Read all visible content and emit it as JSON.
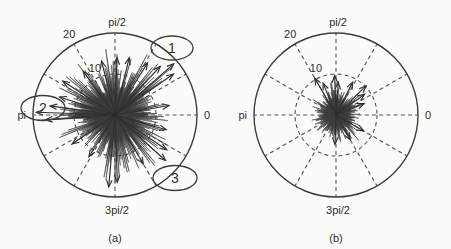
{
  "figure": {
    "background_color": "#fbfbf9",
    "ink_color": "#3c3c3c",
    "blob_color": "#3b3b3b"
  },
  "panels": [
    {
      "caption": "(a)",
      "center": {
        "x": 115,
        "y": 115
      },
      "radius_px": 82,
      "angle_labels": {
        "right": "0",
        "top": "pi/2",
        "left": "pi",
        "bottom": "3pi/2"
      },
      "radial_ticks": [
        {
          "label": "10",
          "value": 10
        },
        {
          "label": "20",
          "value": 20
        }
      ],
      "callouts": [
        {
          "label": "1",
          "cx": 172,
          "cy": 48,
          "rx": 21,
          "ry": 12
        },
        {
          "label": "2",
          "cx": 43,
          "cy": 108,
          "rx": 22,
          "ry": 12.5
        },
        {
          "label": "3",
          "cx": 175,
          "cy": 178,
          "rx": 22,
          "ry": 12.5
        }
      ]
    },
    {
      "caption": "(b)",
      "center": {
        "x": 336,
        "y": 115
      },
      "radius_px": 82,
      "angle_labels": {
        "right": "0",
        "top": "pi/2",
        "left": "pi",
        "bottom": "3pi/2"
      },
      "radial_ticks": [
        {
          "label": "10",
          "value": 10
        },
        {
          "label": "20",
          "value": 20
        }
      ],
      "callouts": []
    }
  ],
  "chart_data": {
    "type": "scatter",
    "subtype": "polar-vector-compass",
    "title": "",
    "xlabel": "",
    "ylabel": "",
    "grid": true,
    "legend_position": "none",
    "angular_unit": "radians",
    "angular_tick_labels": [
      "0",
      "pi/2",
      "pi",
      "3pi/2"
    ],
    "angular_tick_values": [
      0,
      1.5708,
      3.1416,
      4.7124
    ],
    "radial_tick_labels": [
      "10",
      "20"
    ],
    "radial_ticks": [
      10,
      20
    ],
    "rlim": [
      0,
      20
    ],
    "spoke_count": 12,
    "spoke_step_degrees": 30,
    "panels": [
      {
        "name": "(a)",
        "description": "Dense polar vector scatter; many vectors, large spiky envelope, three highlighted outliers",
        "envelope_mean_r": 9.5,
        "envelope_max_r": 18,
        "envelope": [
          {
            "theta_deg": 0,
            "r": 11.5
          },
          {
            "theta_deg": 6,
            "r": 9.0
          },
          {
            "theta_deg": 12,
            "r": 10.4
          },
          {
            "theta_deg": 18,
            "r": 8.2
          },
          {
            "theta_deg": 24,
            "r": 12.0
          },
          {
            "theta_deg": 30,
            "r": 9.1
          },
          {
            "theta_deg": 36,
            "r": 14.5
          },
          {
            "theta_deg": 42,
            "r": 10.2
          },
          {
            "theta_deg": 48,
            "r": 12.8
          },
          {
            "theta_deg": 54,
            "r": 9.4
          },
          {
            "theta_deg": 60,
            "r": 13.6
          },
          {
            "theta_deg": 66,
            "r": 10.0
          },
          {
            "theta_deg": 72,
            "r": 11.2
          },
          {
            "theta_deg": 78,
            "r": 8.6
          },
          {
            "theta_deg": 84,
            "r": 12.4
          },
          {
            "theta_deg": 90,
            "r": 10.6
          },
          {
            "theta_deg": 96,
            "r": 13.2
          },
          {
            "theta_deg": 102,
            "r": 9.0
          },
          {
            "theta_deg": 108,
            "r": 11.0
          },
          {
            "theta_deg": 114,
            "r": 8.4
          },
          {
            "theta_deg": 120,
            "r": 10.2
          },
          {
            "theta_deg": 126,
            "r": 12.2
          },
          {
            "theta_deg": 132,
            "r": 9.6
          },
          {
            "theta_deg": 138,
            "r": 13.0
          },
          {
            "theta_deg": 144,
            "r": 10.8
          },
          {
            "theta_deg": 150,
            "r": 12.6
          },
          {
            "theta_deg": 156,
            "r": 9.2
          },
          {
            "theta_deg": 162,
            "r": 13.8
          },
          {
            "theta_deg": 168,
            "r": 11.4
          },
          {
            "theta_deg": 174,
            "r": 14.6
          },
          {
            "theta_deg": 180,
            "r": 15.8
          },
          {
            "theta_deg": 186,
            "r": 11.0
          },
          {
            "theta_deg": 192,
            "r": 9.4
          },
          {
            "theta_deg": 198,
            "r": 11.6
          },
          {
            "theta_deg": 204,
            "r": 8.8
          },
          {
            "theta_deg": 210,
            "r": 10.4
          },
          {
            "theta_deg": 216,
            "r": 8.0
          },
          {
            "theta_deg": 222,
            "r": 9.8
          },
          {
            "theta_deg": 228,
            "r": 7.6
          },
          {
            "theta_deg": 234,
            "r": 10.0
          },
          {
            "theta_deg": 240,
            "r": 8.4
          },
          {
            "theta_deg": 246,
            "r": 11.2
          },
          {
            "theta_deg": 252,
            "r": 9.0
          },
          {
            "theta_deg": 258,
            "r": 12.4
          },
          {
            "theta_deg": 264,
            "r": 10.2
          },
          {
            "theta_deg": 270,
            "r": 13.0
          },
          {
            "theta_deg": 276,
            "r": 10.6
          },
          {
            "theta_deg": 282,
            "r": 12.0
          },
          {
            "theta_deg": 288,
            "r": 9.4
          },
          {
            "theta_deg": 294,
            "r": 11.8
          },
          {
            "theta_deg": 300,
            "r": 9.0
          },
          {
            "theta_deg": 306,
            "r": 12.6
          },
          {
            "theta_deg": 312,
            "r": 10.0
          },
          {
            "theta_deg": 318,
            "r": 13.4
          },
          {
            "theta_deg": 324,
            "r": 10.4
          },
          {
            "theta_deg": 330,
            "r": 12.2
          },
          {
            "theta_deg": 336,
            "r": 9.6
          },
          {
            "theta_deg": 342,
            "r": 11.0
          },
          {
            "theta_deg": 348,
            "r": 8.8
          },
          {
            "theta_deg": 354,
            "r": 10.6
          }
        ],
        "long_vectors": [
          {
            "theta_deg": 41,
            "r": 19.0,
            "callout": "1"
          },
          {
            "theta_deg": 35,
            "r": 17.4,
            "callout": "1"
          },
          {
            "theta_deg": 47,
            "r": 16.2,
            "callout": "1"
          },
          {
            "theta_deg": 58,
            "r": 15.0
          },
          {
            "theta_deg": 76,
            "r": 14.4
          },
          {
            "theta_deg": 88,
            "r": 14.0
          },
          {
            "theta_deg": 104,
            "r": 13.6
          },
          {
            "theta_deg": 126,
            "r": 13.2
          },
          {
            "theta_deg": 147,
            "r": 15.2
          },
          {
            "theta_deg": 162,
            "r": 14.2
          },
          {
            "theta_deg": 178,
            "r": 19.2,
            "callout": "2"
          },
          {
            "theta_deg": 184,
            "r": 17.0,
            "callout": "2"
          },
          {
            "theta_deg": 172,
            "r": 16.0,
            "callout": "2"
          },
          {
            "theta_deg": 214,
            "r": 12.6
          },
          {
            "theta_deg": 238,
            "r": 12.0
          },
          {
            "theta_deg": 265,
            "r": 17.6
          },
          {
            "theta_deg": 272,
            "r": 16.4
          },
          {
            "theta_deg": 300,
            "r": 13.8
          },
          {
            "theta_deg": 318,
            "r": 16.6,
            "callout": "3"
          },
          {
            "theta_deg": 326,
            "r": 15.2,
            "callout": "3"
          },
          {
            "theta_deg": 344,
            "r": 13.0
          },
          {
            "theta_deg": 10,
            "r": 13.4
          }
        ]
      },
      {
        "name": "(b)",
        "description": "Sparse polar vector scatter; compact envelope near origin with a few long vectors in the upper half",
        "envelope_mean_r": 4.4,
        "envelope_max_r": 7.5,
        "envelope": [
          {
            "theta_deg": 0,
            "r": 4.6
          },
          {
            "theta_deg": 6,
            "r": 3.8
          },
          {
            "theta_deg": 12,
            "r": 5.0
          },
          {
            "theta_deg": 18,
            "r": 4.0
          },
          {
            "theta_deg": 24,
            "r": 5.6
          },
          {
            "theta_deg": 30,
            "r": 4.2
          },
          {
            "theta_deg": 36,
            "r": 6.0
          },
          {
            "theta_deg": 42,
            "r": 4.4
          },
          {
            "theta_deg": 48,
            "r": 5.4
          },
          {
            "theta_deg": 54,
            "r": 4.0
          },
          {
            "theta_deg": 60,
            "r": 5.8
          },
          {
            "theta_deg": 66,
            "r": 4.6
          },
          {
            "theta_deg": 72,
            "r": 5.2
          },
          {
            "theta_deg": 78,
            "r": 4.2
          },
          {
            "theta_deg": 84,
            "r": 6.2
          },
          {
            "theta_deg": 90,
            "r": 5.0
          },
          {
            "theta_deg": 96,
            "r": 6.4
          },
          {
            "theta_deg": 102,
            "r": 4.4
          },
          {
            "theta_deg": 108,
            "r": 5.2
          },
          {
            "theta_deg": 114,
            "r": 4.0
          },
          {
            "theta_deg": 120,
            "r": 5.6
          },
          {
            "theta_deg": 126,
            "r": 4.6
          },
          {
            "theta_deg": 132,
            "r": 5.0
          },
          {
            "theta_deg": 138,
            "r": 4.2
          },
          {
            "theta_deg": 144,
            "r": 5.4
          },
          {
            "theta_deg": 150,
            "r": 4.0
          },
          {
            "theta_deg": 156,
            "r": 4.8
          },
          {
            "theta_deg": 162,
            "r": 3.8
          },
          {
            "theta_deg": 168,
            "r": 4.6
          },
          {
            "theta_deg": 174,
            "r": 3.6
          },
          {
            "theta_deg": 180,
            "r": 4.4
          },
          {
            "theta_deg": 186,
            "r": 3.8
          },
          {
            "theta_deg": 192,
            "r": 4.8
          },
          {
            "theta_deg": 198,
            "r": 3.6
          },
          {
            "theta_deg": 204,
            "r": 4.4
          },
          {
            "theta_deg": 210,
            "r": 3.8
          },
          {
            "theta_deg": 216,
            "r": 4.6
          },
          {
            "theta_deg": 222,
            "r": 3.4
          },
          {
            "theta_deg": 228,
            "r": 4.2
          },
          {
            "theta_deg": 234,
            "r": 3.6
          },
          {
            "theta_deg": 240,
            "r": 4.8
          },
          {
            "theta_deg": 246,
            "r": 3.8
          },
          {
            "theta_deg": 252,
            "r": 5.0
          },
          {
            "theta_deg": 258,
            "r": 4.0
          },
          {
            "theta_deg": 264,
            "r": 5.4
          },
          {
            "theta_deg": 270,
            "r": 4.4
          },
          {
            "theta_deg": 276,
            "r": 5.2
          },
          {
            "theta_deg": 282,
            "r": 4.0
          },
          {
            "theta_deg": 288,
            "r": 5.6
          },
          {
            "theta_deg": 294,
            "r": 4.2
          },
          {
            "theta_deg": 300,
            "r": 5.8
          },
          {
            "theta_deg": 306,
            "r": 4.4
          },
          {
            "theta_deg": 312,
            "r": 6.6
          },
          {
            "theta_deg": 318,
            "r": 4.8
          },
          {
            "theta_deg": 324,
            "r": 5.4
          },
          {
            "theta_deg": 330,
            "r": 4.0
          },
          {
            "theta_deg": 336,
            "r": 5.0
          },
          {
            "theta_deg": 342,
            "r": 3.8
          },
          {
            "theta_deg": 348,
            "r": 4.6
          },
          {
            "theta_deg": 354,
            "r": 3.8
          }
        ],
        "long_vectors": [
          {
            "theta_deg": 120,
            "r": 10.4
          },
          {
            "theta_deg": 112,
            "r": 8.4
          },
          {
            "theta_deg": 92,
            "r": 9.6
          },
          {
            "theta_deg": 86,
            "r": 8.0
          },
          {
            "theta_deg": 63,
            "r": 9.0
          },
          {
            "theta_deg": 44,
            "r": 10.2
          },
          {
            "theta_deg": 36,
            "r": 8.6
          },
          {
            "theta_deg": 22,
            "r": 7.4
          },
          {
            "theta_deg": 330,
            "r": 7.8
          },
          {
            "theta_deg": 300,
            "r": 7.0
          },
          {
            "theta_deg": 268,
            "r": 7.2
          }
        ]
      }
    ]
  }
}
